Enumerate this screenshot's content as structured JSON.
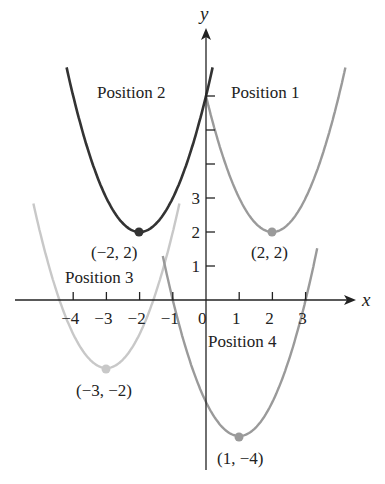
{
  "figure": {
    "x_axis_label": "x",
    "y_axis_label": "y",
    "x_ticks": [
      "−4",
      "−3",
      "−2",
      "−1",
      "0",
      "1",
      "2",
      "3"
    ],
    "y_ticks": [
      "1",
      "2",
      "3"
    ],
    "labels": {
      "position1": "Position 1",
      "position2": "Position 2",
      "position3": "Position 3",
      "position4": "Position 4"
    },
    "vertices": {
      "v1": "(2, 2)",
      "v2": "(−2, 2)",
      "v3": "(−3, −2)",
      "v4": "(1, −4)"
    },
    "colors": {
      "position1": "#9a9a9a",
      "position2": "#333333",
      "position3": "#c8c8c8",
      "position4": "#9a9a9a",
      "axis": "#222222"
    }
  },
  "chart_data": {
    "type": "line",
    "title": "",
    "xlabel": "x",
    "ylabel": "y",
    "xlim": [
      -5,
      4.5
    ],
    "ylim": [
      -4.5,
      8
    ],
    "grid": false,
    "series": [
      {
        "name": "Position 1",
        "equation": "y = (x - 2)^2 + 2",
        "vertex": [
          2,
          2
        ]
      },
      {
        "name": "Position 2",
        "equation": "y = (x + 2)^2 + 2",
        "vertex": [
          -2,
          2
        ]
      },
      {
        "name": "Position 3",
        "equation": "y = (x + 3)^2 - 2",
        "vertex": [
          -3,
          -2
        ]
      },
      {
        "name": "Position 4",
        "equation": "y = (x - 1)^2 - 4",
        "vertex": [
          1,
          -4
        ]
      }
    ],
    "x_tick_values": [
      -4,
      -3,
      -2,
      -1,
      0,
      1,
      2,
      3
    ],
    "y_tick_values": [
      1,
      2,
      3,
      4,
      5,
      6
    ],
    "y_tick_labels_shown": [
      1,
      2,
      3
    ]
  }
}
